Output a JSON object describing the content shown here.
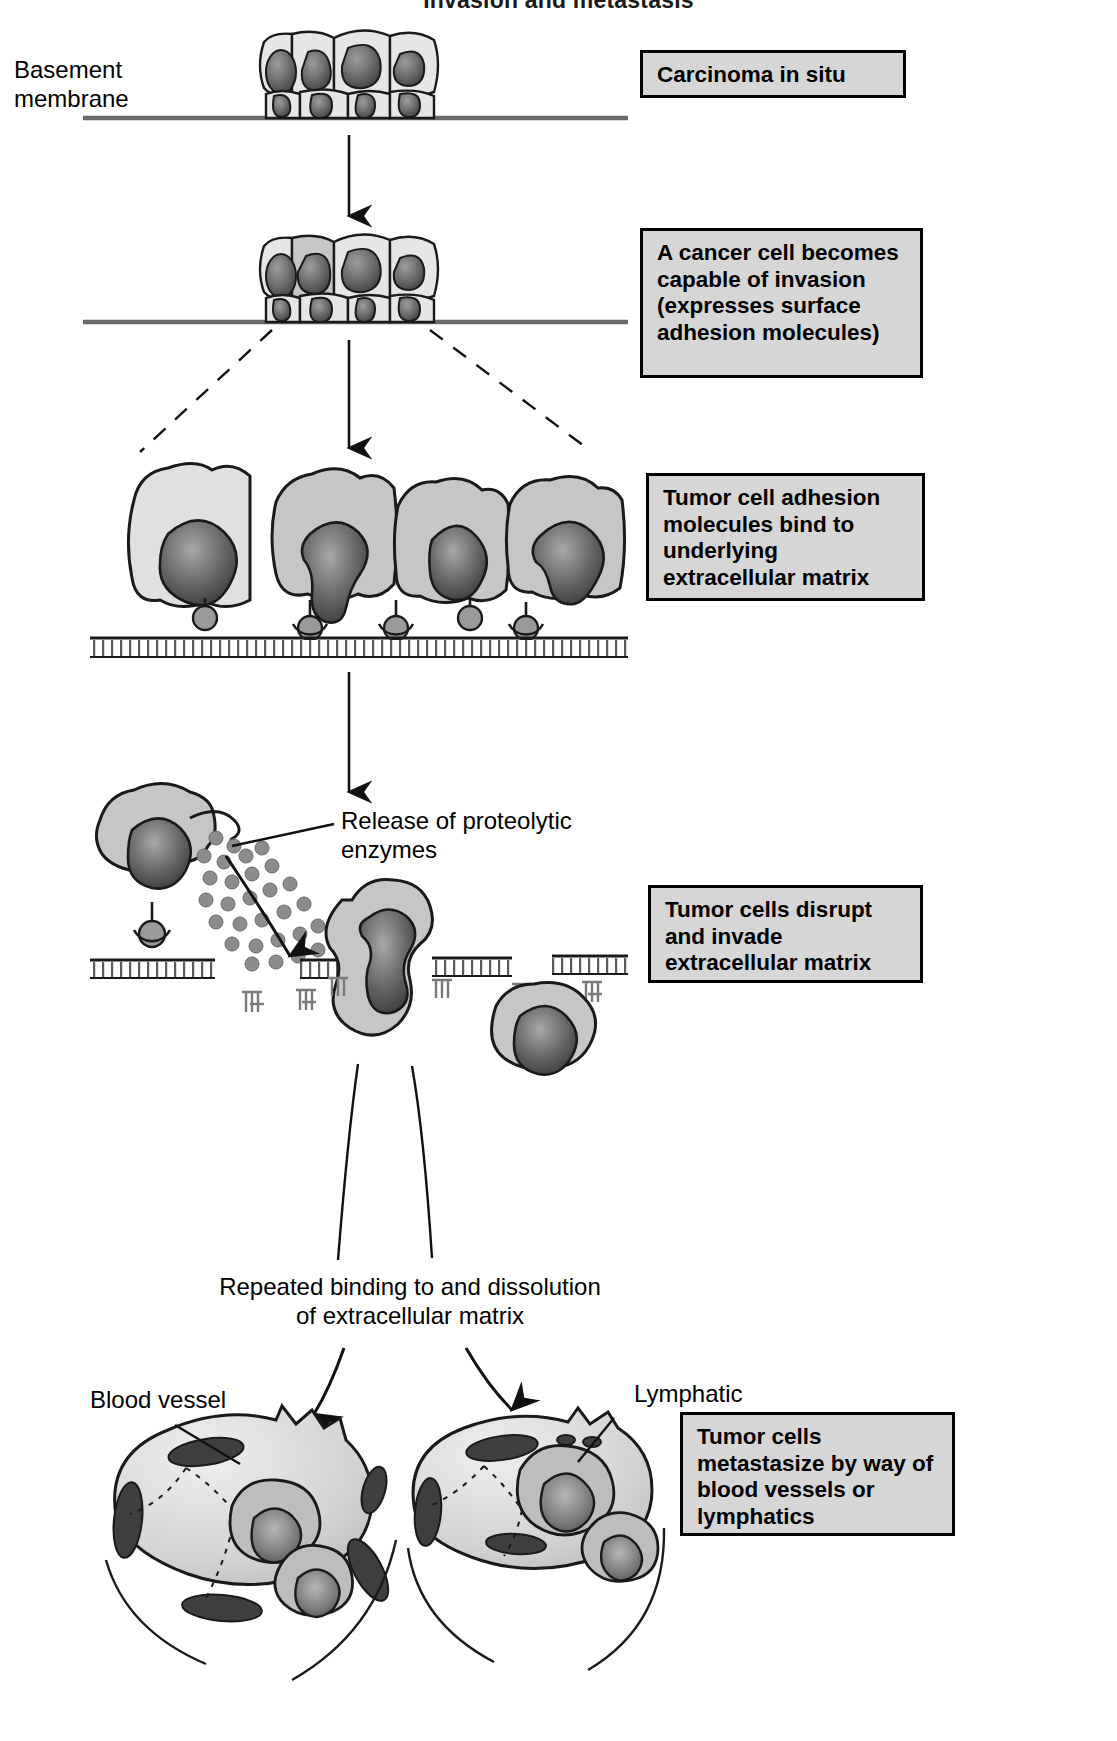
{
  "header": {
    "title": "Invasion and metastasis"
  },
  "labels": {
    "basement_membrane": "Basement\nmembrane",
    "release_enzymes": "Release of proteolytic\nenzymes",
    "repeated_binding_line1": "Repeated binding to and dissolution",
    "repeated_binding_line2": "of extracellular matrix",
    "blood_vessel": "Blood vessel",
    "lymphatic": "Lymphatic"
  },
  "callouts": [
    {
      "id": "carcinoma-in-situ",
      "text": "Carcinoma in situ"
    },
    {
      "id": "cancer-cell-invasion",
      "text": "A cancer cell becomes capable of invasion (expresses surface adhesion molecules)"
    },
    {
      "id": "adhesion-binding",
      "text": "Tumor cell adhesion molecules bind to underlying extracellular matrix"
    },
    {
      "id": "disrupt-invade",
      "text": "Tumor cells disrupt and invade extracellular matrix"
    },
    {
      "id": "metastasize",
      "text": "Tumor cells metastasize by way of blood vessels or lymphatics"
    }
  ],
  "colors": {
    "callout_fill": "#d6d6d6",
    "callout_border": "#000000",
    "cell_light": "#e3e3e3",
    "cell_mid": "#bdbdbd",
    "nucleus_dark": "#4a4a4a",
    "nucleus_mid": "#8a8a8a",
    "membrane_line": "#555555",
    "outline": "#1a1a1a",
    "page_bg": "#ffffff"
  }
}
